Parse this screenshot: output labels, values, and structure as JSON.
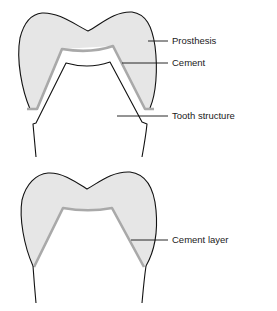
{
  "figure": {
    "top_panel": {
      "labels": {
        "prosthesis": "Prosthesis",
        "cement": "Cement",
        "tooth_structure": "Tooth structure"
      }
    },
    "bottom_panel": {
      "labels": {
        "cement_layer": "Cement layer"
      }
    }
  },
  "colors": {
    "prosthesis_fill": "#e6e6e6",
    "cement": "#a9a9a9",
    "outline": "#111111",
    "background": "#ffffff"
  }
}
